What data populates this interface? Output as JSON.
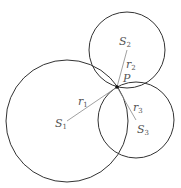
{
  "diagram": {
    "title": "",
    "point": {
      "label": "P",
      "x": 117,
      "y": 87
    },
    "circles": [
      {
        "name": "S1",
        "center_label": "S",
        "center_sub": "1",
        "radius_label": "r",
        "radius_sub": "1",
        "cx": 67,
        "cy": 121,
        "r": 61
      },
      {
        "name": "S2",
        "center_label": "S",
        "center_sub": "2",
        "radius_label": "r",
        "radius_sub": "2",
        "cx": 127,
        "cy": 50,
        "r": 38
      },
      {
        "name": "S3",
        "center_label": "S",
        "center_sub": "3",
        "radius_label": "r",
        "radius_sub": "3",
        "cx": 136,
        "cy": 120,
        "r": 38
      }
    ],
    "colors": {
      "stroke": "#333333",
      "radius_line": "#777777",
      "text": "#555555"
    }
  }
}
